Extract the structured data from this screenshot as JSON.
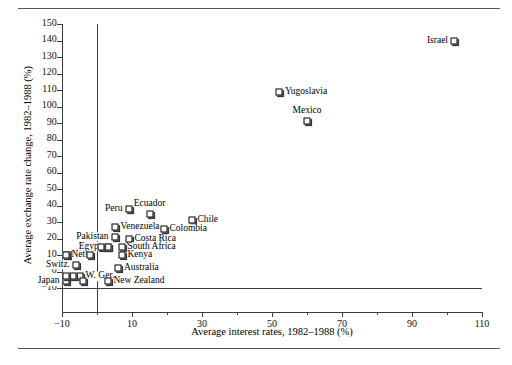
{
  "chart_data": {
    "type": "scatter",
    "title": "",
    "xlabel": "Average interest rates, 1982–1988 (%)",
    "ylabel": "Average exchange rate change, 1982–1988 (%)",
    "xlim": [
      -10,
      110
    ],
    "ylim": [
      -10,
      150
    ],
    "xticks": [
      -10,
      10,
      30,
      50,
      70,
      90,
      110
    ],
    "xtick_labels": [
      "−10",
      "10",
      "30",
      "50",
      "70",
      "90",
      "110"
    ],
    "xminor_ticks": [
      0,
      20,
      40,
      60,
      80,
      100
    ],
    "yticks": [
      -10,
      0,
      10,
      20,
      30,
      40,
      50,
      60,
      70,
      80,
      90,
      100,
      110,
      120,
      130,
      140,
      150
    ],
    "ytick_labels": [
      "−10",
      "0",
      "10",
      "20",
      "30",
      "40",
      "50",
      "60",
      "70",
      "80",
      "90",
      "100",
      "110",
      "120",
      "130",
      "140",
      "150"
    ],
    "grid": false,
    "legend": "none",
    "marker": "white-square-with-shadow",
    "reference_lines": [
      {
        "axis": "vertical",
        "value": 0
      },
      {
        "axis": "horizontal",
        "value": 0
      }
    ],
    "points": [
      {
        "label": "Israel",
        "x": 102,
        "y": 140,
        "label_pos": "left"
      },
      {
        "label": "Yugoslavia",
        "x": 52,
        "y": 109,
        "label_pos": "right"
      },
      {
        "label": "Mexico",
        "x": 60,
        "y": 91,
        "label_pos": "above"
      },
      {
        "label": "Peru",
        "x": 9,
        "y": 38,
        "label_pos": "left"
      },
      {
        "label": "Ecuador",
        "x": 15,
        "y": 35,
        "label_pos": "above"
      },
      {
        "label": "Chile",
        "x": 27,
        "y": 31,
        "label_pos": "right"
      },
      {
        "label": "Venezuela",
        "x": 5,
        "y": 27,
        "label_pos": "right"
      },
      {
        "label": "Colombia",
        "x": 19,
        "y": 26,
        "label_pos": "right"
      },
      {
        "label": "Pakistan",
        "x": 5,
        "y": 21,
        "label_pos": "left"
      },
      {
        "label": "Costa Rica",
        "x": 9,
        "y": 20,
        "label_pos": "right"
      },
      {
        "label": "Nepal",
        "x": 3,
        "y": 15,
        "label_pos": "left"
      },
      {
        "label": "Egypt",
        "x": 3,
        "y": 15,
        "label_pos": "left"
      },
      {
        "label": "South Africa",
        "x": 7,
        "y": 15,
        "label_pos": "right"
      },
      {
        "label": "Hun.",
        "x": -8,
        "y": 10,
        "label_pos": "right"
      },
      {
        "label": "Neth.",
        "x": -9,
        "y": 10,
        "label_pos": "right"
      },
      {
        "label": "Kenya",
        "x": 7,
        "y": 10,
        "label_pos": "right"
      },
      {
        "label": "Switz.",
        "x": -6,
        "y": 4,
        "label_pos": "left"
      },
      {
        "label": "Australia",
        "x": 6,
        "y": 2,
        "label_pos": "right"
      },
      {
        "label": "W. Ger.",
        "x": -5,
        "y": -3,
        "label_pos": "right"
      },
      {
        "label": "Japan",
        "x": -9,
        "y": -6,
        "label_pos": "left"
      },
      {
        "label": "New Zealand",
        "x": 3,
        "y": -6,
        "label_pos": "right"
      }
    ],
    "extra_markers": [
      {
        "x": -9,
        "y": 10
      },
      {
        "x": -7,
        "y": -3
      },
      {
        "x": -9,
        "y": -3
      },
      {
        "x": -4,
        "y": -6
      },
      {
        "x": -2,
        "y": 10
      },
      {
        "x": 1,
        "y": 15
      }
    ]
  },
  "colors": {
    "rule": "#5a5a5a",
    "axis": "#3c3c3c",
    "marker_fill": "#ffffff",
    "marker_edge": "#000000",
    "marker_shadow": "#333333",
    "text": "#000000"
  }
}
